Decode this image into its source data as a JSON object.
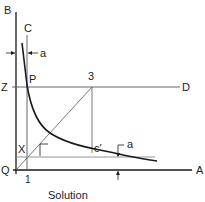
{
  "diagram": {
    "caption": "Solution",
    "labels": {
      "B": "B",
      "A": "A",
      "Q": "Q",
      "C": "C",
      "a_top": "a",
      "P": "P",
      "Z": "Z",
      "three": "3",
      "D": "D",
      "X": "X",
      "c_prime": "c′",
      "a_bottom": "a",
      "one": "1"
    },
    "colors": {
      "line": "#1a1a1a",
      "thin_line": "#555555",
      "background": "#ffffff"
    }
  }
}
